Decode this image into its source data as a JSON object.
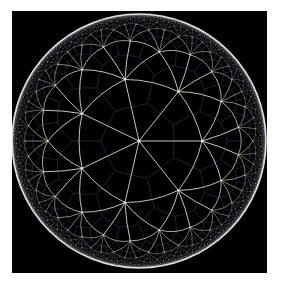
{
  "tiling": {
    "p": 3,
    "q": 7,
    "center": [
      139,
      141
    ],
    "radius": 127,
    "rotation_deg": 0,
    "max_depth": 9,
    "min_edge_px": 0.9
  },
  "colors": {
    "page_background": "#ffffff",
    "frame_background": "#000000",
    "edge_color": "#dcd8c6",
    "dual_color": "#2e2c4a",
    "vertex_color": "#f2efe0",
    "rim_color": "#f4f4f8"
  }
}
